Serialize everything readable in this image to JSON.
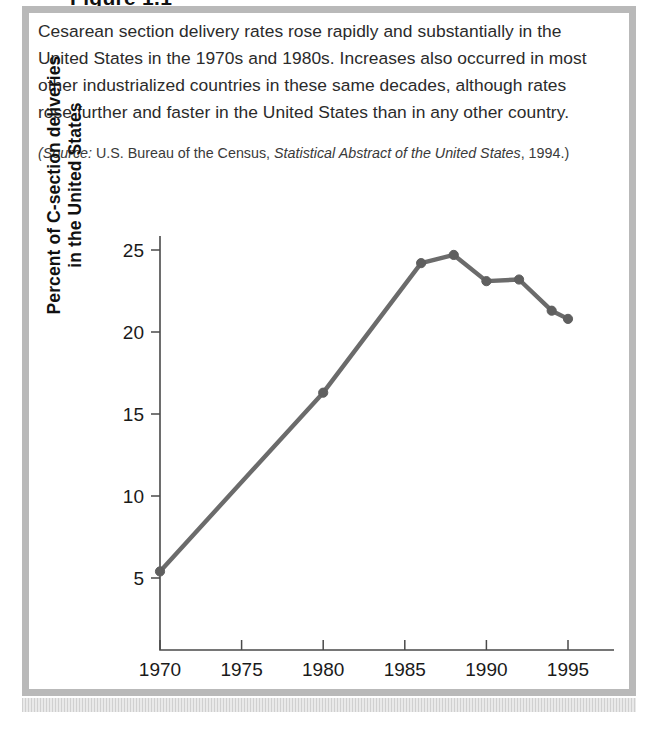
{
  "figure": {
    "title_partial": "Figure 1.1",
    "caption": "Cesarean section delivery rates rose rapidly and substantially in the United States in the 1970s and 1980s. Increases also occurred in most other industrialized countries in these same decades, although rates rose further and faster in the United States than in any other country.",
    "source_prefix": "(Source:",
    "source_publisher": " U.S. Bureau of the Census, ",
    "source_work": "Statistical Abstract of the United States",
    "source_suffix": ", 1994.)"
  },
  "chart_data": {
    "type": "line",
    "title": "",
    "xlabel": "",
    "ylabel_line1": "Percent of C-section deliveries",
    "ylabel_line2": "in the United States",
    "x": [
      1970,
      1980,
      1986,
      1988,
      1990,
      1992,
      1994,
      1995
    ],
    "values": [
      5.4,
      16.3,
      24.2,
      24.7,
      23.1,
      23.2,
      21.3,
      20.8
    ],
    "series": [
      {
        "name": "Percent of C-section deliveries in the United States",
        "values": [
          5.4,
          16.3,
          24.2,
          24.7,
          23.1,
          23.2,
          21.3,
          20.8
        ]
      }
    ],
    "xlim": [
      1969,
      1996
    ],
    "ylim": [
      3.0,
      26.2
    ],
    "xticks": [
      1970,
      1975,
      1980,
      1985,
      1990,
      1995
    ],
    "xtick_labels": [
      "1970",
      "1975",
      "1980",
      "1985",
      "1990",
      "1995"
    ],
    "yticks": [
      5,
      10,
      15,
      20,
      25
    ],
    "ytick_labels": [
      "5",
      "10",
      "15",
      "20",
      "25"
    ],
    "grid": false,
    "legend": false,
    "line_color": "#6b6b6b",
    "marker_color": "#5f5f5f",
    "axis_color": "#4a4a4a"
  }
}
